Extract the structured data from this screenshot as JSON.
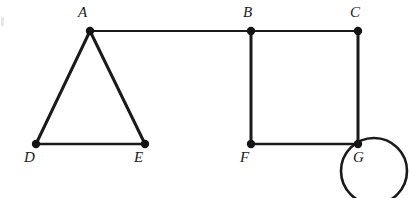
{
  "figure": {
    "width": 409,
    "height": 198,
    "background": "#ffffff",
    "ink_color": "#1a1a1a"
  },
  "vertices": [
    {
      "id": "A",
      "label": "A",
      "x": 90,
      "y": 31,
      "radius": 4.2,
      "label_x": 78,
      "label_y": 5
    },
    {
      "id": "B",
      "label": "B",
      "x": 251,
      "y": 31,
      "radius": 4.2,
      "label_x": 243,
      "label_y": 5
    },
    {
      "id": "C",
      "label": "C",
      "x": 358,
      "y": 31,
      "radius": 4.2,
      "label_x": 350,
      "label_y": 5
    },
    {
      "id": "D",
      "label": "D",
      "x": 36,
      "y": 144,
      "radius": 4.2,
      "label_x": 24,
      "label_y": 150
    },
    {
      "id": "E",
      "label": "E",
      "x": 145,
      "y": 144,
      "radius": 4.2,
      "label_x": 134,
      "label_y": 150
    },
    {
      "id": "F",
      "label": "F",
      "x": 251,
      "y": 144,
      "radius": 4.2,
      "label_x": 240,
      "label_y": 150
    },
    {
      "id": "G",
      "label": "G",
      "x": 358,
      "y": 144,
      "radius": 4.2,
      "label_x": 353,
      "label_y": 150
    }
  ],
  "edges": [
    {
      "id": "AB",
      "from": "A",
      "to": "B",
      "x1": 90,
      "y1": 31,
      "x2": 251,
      "y2": 31,
      "width": 2.2
    },
    {
      "id": "BC",
      "from": "B",
      "to": "C",
      "x1": 251,
      "y1": 31,
      "x2": 358,
      "y2": 31,
      "width": 2.2
    },
    {
      "id": "AD",
      "from": "A",
      "to": "D",
      "x1": 90,
      "y1": 31,
      "x2": 36,
      "y2": 144,
      "width": 3.0
    },
    {
      "id": "AE",
      "from": "A",
      "to": "E",
      "x1": 90,
      "y1": 31,
      "x2": 145,
      "y2": 144,
      "width": 3.0
    },
    {
      "id": "DE",
      "from": "D",
      "to": "E",
      "x1": 36,
      "y1": 144,
      "x2": 145,
      "y2": 144,
      "width": 2.4
    },
    {
      "id": "BF",
      "from": "B",
      "to": "F",
      "x1": 251,
      "y1": 31,
      "x2": 251,
      "y2": 144,
      "width": 3.0
    },
    {
      "id": "FG",
      "from": "F",
      "to": "G",
      "x1": 251,
      "y1": 144,
      "x2": 358,
      "y2": 144,
      "width": 2.6
    },
    {
      "id": "CG",
      "from": "C",
      "to": "G",
      "x1": 358,
      "y1": 31,
      "x2": 358,
      "y2": 144,
      "width": 3.0
    }
  ],
  "self_loop": {
    "id": "GG",
    "at_vertex": "G",
    "center_x": 374,
    "center_y": 171,
    "radius": 33,
    "width": 2.6,
    "note": "loop circle is clipped by the bottom edge of the figure"
  }
}
